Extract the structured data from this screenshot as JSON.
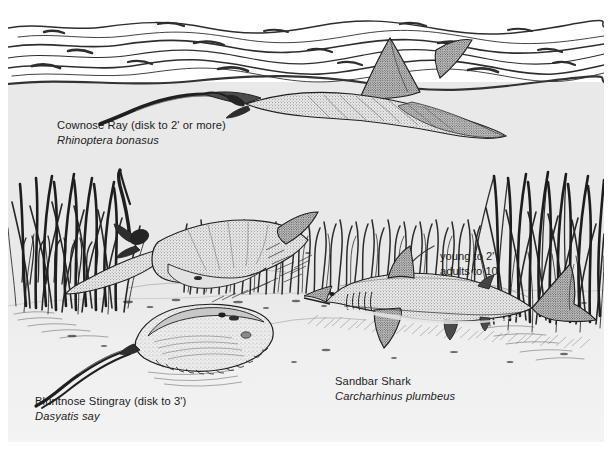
{
  "illustration": {
    "title": "Chesapeake Bay seagrass habitat with rays and shark",
    "style": "pen-and-ink stipple scientific illustration",
    "background_color": "#e9e9e9",
    "sand_color": "#f1f1f1",
    "ink_color": "#1c1c1c",
    "border_color": "#ffffff"
  },
  "labels": {
    "cownose_ray": {
      "common": "Cownose Ray (disk to 2' or more)",
      "scientific": "Rhinoptera bonasus"
    },
    "bluntnose_stingray": {
      "common": "Bluntnose Stingray (disk to 3')",
      "scientific": "Dasyatis say"
    },
    "sandbar_shark": {
      "common": "Sandbar Shark",
      "scientific": "Carcharhinus plumbeus"
    }
  },
  "annotations": {
    "shark_size": {
      "line1": "young to 2'",
      "line2": "adults to 10'"
    }
  },
  "scene_elements": {
    "water_surface": "wavy ink lines across top",
    "seagrass_left": "dense blade clump at left edge",
    "seagrass_mid": "midground grass band",
    "seagrass_right": "dense blade clump at right edge",
    "sea_floor": "sandy bottom with scattered debris"
  }
}
